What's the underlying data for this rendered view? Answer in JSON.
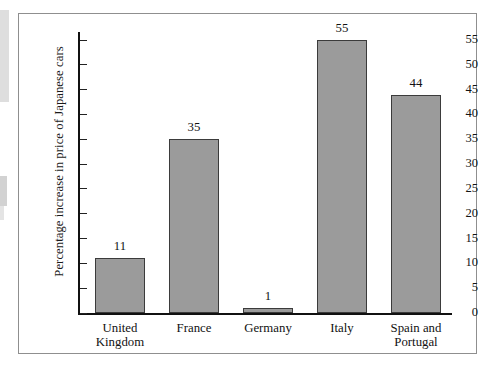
{
  "chart_data": {
    "type": "bar",
    "title": "",
    "xlabel": "",
    "ylabel": "Percentage increase in price of Japanese cars",
    "categories": [
      "United Kingdom",
      "France",
      "Germany",
      "Italy",
      "Spain and Portugal"
    ],
    "category_lines": [
      [
        "United",
        "Kingdom"
      ],
      [
        "France",
        ""
      ],
      [
        "Germany",
        ""
      ],
      [
        "Italy",
        ""
      ],
      [
        "Spain and",
        "Portugal"
      ]
    ],
    "values": [
      11,
      35,
      1,
      55,
      44
    ],
    "value_labels": [
      "11",
      "35",
      "1",
      "55",
      "44"
    ],
    "ylim": [
      0,
      55
    ],
    "ytick_step": 5,
    "ytick_labels": [
      "55",
      "50",
      "45",
      "40",
      "35",
      "30",
      "25",
      "20",
      "15",
      "10",
      "5",
      "0"
    ],
    "ytick_values": [
      55,
      50,
      45,
      40,
      35,
      30,
      25,
      20,
      15,
      10,
      5,
      0
    ],
    "grid": false,
    "legend": false,
    "bar_color": "#9b9b9b",
    "bar_border_color": "#3b3b3b",
    "axis_color": "#111111",
    "frame_color": "#8f8f8f",
    "background_color": "#ffffff"
  }
}
